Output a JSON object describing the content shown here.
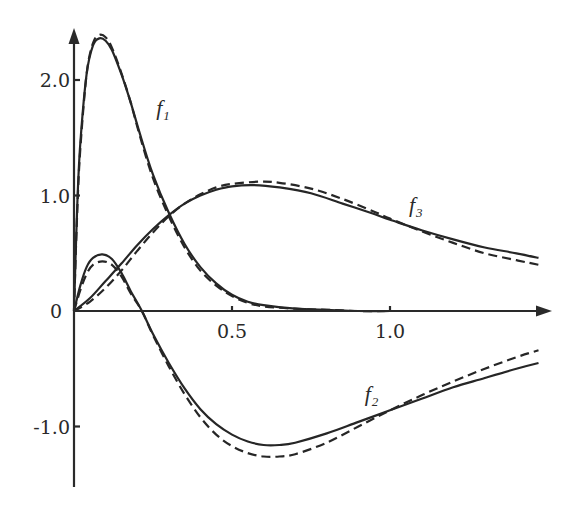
{
  "chart_data": {
    "type": "line",
    "title": "",
    "xlabel": "",
    "ylabel": "",
    "xlim": [
      0,
      1.5
    ],
    "ylim": [
      -1.5,
      2.4
    ],
    "grid": false,
    "legend": "inline curve labels",
    "x_ticks": [
      {
        "value": 0.5,
        "label": "0.5"
      },
      {
        "value": 1.0,
        "label": "1.0"
      }
    ],
    "y_ticks": [
      {
        "value": 2.0,
        "label": "2.0"
      },
      {
        "value": 1.0,
        "label": "1.0"
      },
      {
        "value": 0,
        "label": "0"
      },
      {
        "value": -1.0,
        "label": "-1.0"
      }
    ],
    "annotations": [
      {
        "text": "f",
        "subscript": "1",
        "x": 0.26,
        "y": 1.7
      },
      {
        "text": "f",
        "subscript": "3",
        "x": 1.06,
        "y": 0.86
      },
      {
        "text": "f",
        "subscript": "2",
        "x": 0.92,
        "y": -0.78
      }
    ],
    "series": [
      {
        "name": "f1",
        "style": "solid",
        "x": [
          0,
          0.01,
          0.02,
          0.04,
          0.06,
          0.08,
          0.1,
          0.12,
          0.15,
          0.18,
          0.21,
          0.25,
          0.3,
          0.35,
          0.4,
          0.45,
          0.5,
          0.55,
          0.6,
          0.7,
          0.8,
          0.9,
          1.0
        ],
        "y": [
          0,
          0.9,
          1.45,
          2.05,
          2.3,
          2.36,
          2.34,
          2.26,
          2.05,
          1.8,
          1.52,
          1.18,
          0.85,
          0.58,
          0.38,
          0.24,
          0.14,
          0.08,
          0.05,
          0.02,
          0.01,
          0.0,
          0.0
        ]
      },
      {
        "name": "f1 (dashed)",
        "style": "dashed",
        "x": [
          0,
          0.01,
          0.02,
          0.04,
          0.06,
          0.08,
          0.1,
          0.12,
          0.15,
          0.18,
          0.21,
          0.25,
          0.3,
          0.35,
          0.4,
          0.45,
          0.5,
          0.55,
          0.6,
          0.7,
          0.8,
          0.9,
          1.0
        ],
        "y": [
          0,
          0.85,
          1.4,
          2.05,
          2.32,
          2.39,
          2.37,
          2.28,
          2.06,
          1.8,
          1.5,
          1.15,
          0.82,
          0.55,
          0.35,
          0.22,
          0.13,
          0.07,
          0.04,
          0.02,
          0.01,
          0.0,
          0.0
        ]
      },
      {
        "name": "f2",
        "style": "solid",
        "x": [
          0,
          0.02,
          0.04,
          0.06,
          0.09,
          0.12,
          0.15,
          0.18,
          0.215,
          0.25,
          0.3,
          0.35,
          0.4,
          0.45,
          0.5,
          0.55,
          0.6,
          0.65,
          0.7,
          0.8,
          0.9,
          1.0,
          1.1,
          1.2,
          1.3,
          1.4,
          1.47
        ],
        "y": [
          0,
          0.22,
          0.38,
          0.46,
          0.49,
          0.45,
          0.33,
          0.17,
          0.0,
          -0.2,
          -0.45,
          -0.67,
          -0.85,
          -0.98,
          -1.07,
          -1.13,
          -1.16,
          -1.16,
          -1.14,
          -1.06,
          -0.96,
          -0.86,
          -0.76,
          -0.66,
          -0.58,
          -0.5,
          -0.45
        ]
      },
      {
        "name": "f2 (dashed)",
        "style": "dashed",
        "x": [
          0,
          0.02,
          0.04,
          0.06,
          0.09,
          0.12,
          0.15,
          0.18,
          0.215,
          0.25,
          0.3,
          0.35,
          0.4,
          0.45,
          0.5,
          0.55,
          0.6,
          0.65,
          0.7,
          0.8,
          0.9,
          1.0,
          1.1,
          1.2,
          1.3,
          1.4,
          1.47
        ],
        "y": [
          0,
          0.18,
          0.32,
          0.4,
          0.43,
          0.4,
          0.3,
          0.15,
          0.0,
          -0.21,
          -0.48,
          -0.72,
          -0.92,
          -1.07,
          -1.17,
          -1.23,
          -1.26,
          -1.26,
          -1.24,
          -1.14,
          -1.0,
          -0.86,
          -0.73,
          -0.61,
          -0.5,
          -0.4,
          -0.34
        ]
      },
      {
        "name": "f3",
        "style": "solid",
        "x": [
          0,
          0.05,
          0.1,
          0.15,
          0.2,
          0.25,
          0.3,
          0.35,
          0.4,
          0.45,
          0.5,
          0.57,
          0.65,
          0.75,
          0.85,
          0.95,
          1.0,
          1.1,
          1.2,
          1.3,
          1.4,
          1.47
        ],
        "y": [
          0,
          0.11,
          0.26,
          0.41,
          0.57,
          0.71,
          0.83,
          0.93,
          1.0,
          1.05,
          1.08,
          1.09,
          1.07,
          1.02,
          0.93,
          0.84,
          0.79,
          0.7,
          0.62,
          0.55,
          0.5,
          0.46
        ]
      },
      {
        "name": "f3 (dashed)",
        "style": "dashed",
        "x": [
          0,
          0.05,
          0.1,
          0.15,
          0.2,
          0.25,
          0.3,
          0.35,
          0.4,
          0.45,
          0.5,
          0.59,
          0.65,
          0.75,
          0.85,
          0.95,
          1.0,
          1.1,
          1.2,
          1.3,
          1.4,
          1.47
        ],
        "y": [
          0,
          0.08,
          0.2,
          0.35,
          0.52,
          0.68,
          0.82,
          0.93,
          1.01,
          1.07,
          1.1,
          1.12,
          1.11,
          1.06,
          0.97,
          0.86,
          0.8,
          0.69,
          0.59,
          0.5,
          0.44,
          0.4
        ]
      }
    ]
  }
}
